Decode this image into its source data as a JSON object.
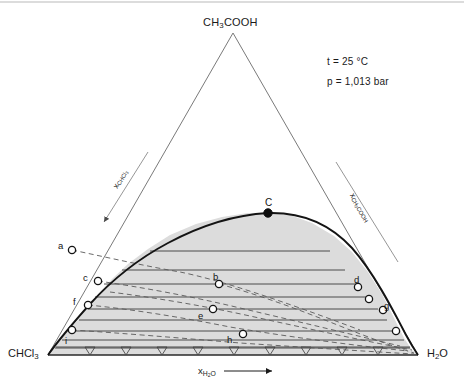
{
  "diagram": {
    "type": "ternary-phase-diagram",
    "title_apex": "CH3COOH",
    "corner_left": "CHCl3",
    "corner_right": "H2O",
    "conditions": {
      "temperature": "t = 25 °C",
      "pressure": "p = 1,013 bar"
    },
    "axes": {
      "bottom_label": "x",
      "bottom_sub": "H₂O",
      "left_label": "x",
      "left_sub": "CHCl₃",
      "right_label": "x",
      "right_sub": "CH₃COOH"
    },
    "colors": {
      "two_phase_fill": "#d9d9d9",
      "binodal_curve": "#1a1a1a",
      "tie_line": "#333333",
      "conjugate_dashed": "#555555",
      "triangle_edge": "#6b6b6b",
      "text": "#1a1a1a"
    },
    "plait_point": {
      "label": "C",
      "x": 268,
      "y": 214,
      "filled": true
    },
    "points": [
      {
        "label": "a",
        "x": 72,
        "y": 250,
        "label_dx": -11,
        "label_dy": -4,
        "on_curve": false
      },
      {
        "label": "c",
        "x": 98,
        "y": 281,
        "label_dx": -12,
        "label_dy": -3,
        "on_curve": true
      },
      {
        "label": "f",
        "x": 88,
        "y": 305,
        "label_dx": -12,
        "label_dy": -3,
        "on_curve": true
      },
      {
        "label": "i",
        "x": 72,
        "y": 330,
        "label_dx": -4,
        "label_dy": 11,
        "on_curve": true
      },
      {
        "label": "b",
        "x": 219,
        "y": 284,
        "label_dx": -3,
        "label_dy": -7,
        "on_curve": false
      },
      {
        "label": "e",
        "x": 213,
        "y": 309,
        "label_dx": -12,
        "label_dy": 7,
        "on_curve": false
      },
      {
        "label": "h",
        "x": 243,
        "y": 334,
        "label_dx": -13,
        "label_dy": 6,
        "on_curve": false
      },
      {
        "label": "d",
        "x": 358,
        "y": 287,
        "label_dx": -1,
        "label_dy": -7,
        "on_curve": true
      },
      {
        "label": "g",
        "x": 383,
        "y": 310,
        "label_dx": 4,
        "label_dy": -4,
        "on_curve": true
      },
      {
        "label": "",
        "x": 368,
        "y": 298,
        "label_dx": 0,
        "label_dy": 0,
        "on_curve": true
      },
      {
        "label": "",
        "x": 396,
        "y": 330,
        "label_dx": 0,
        "label_dy": 0,
        "on_curve": true
      }
    ],
    "tie_line_count": 9,
    "tick_count": 9,
    "region_note": "two-phase miscibility gap below binodal curve"
  },
  "chart_data": {
    "type": "scatter",
    "xlabel": "x_H2O",
    "ylabel": "x_CHCl3 / x_CH3COOH",
    "legend": [],
    "annotations": [
      "t = 25 °C",
      "p = 1,013 bar"
    ],
    "labeled_points": [
      "a",
      "b",
      "c",
      "d",
      "e",
      "f",
      "g",
      "h",
      "i",
      "C"
    ],
    "binodal_curve": [
      [
        48,
        355
      ],
      [
        58,
        341
      ],
      [
        68,
        331
      ],
      [
        78,
        320
      ],
      [
        88,
        307
      ],
      [
        100,
        292
      ],
      [
        112,
        279
      ],
      [
        128,
        264
      ],
      [
        148,
        249
      ],
      [
        170,
        235
      ],
      [
        196,
        224
      ],
      [
        222,
        217
      ],
      [
        248,
        213
      ],
      [
        268,
        213
      ],
      [
        290,
        215
      ],
      [
        312,
        223
      ],
      [
        334,
        236
      ],
      [
        352,
        252
      ],
      [
        368,
        272
      ],
      [
        382,
        294
      ],
      [
        394,
        318
      ],
      [
        404,
        338
      ],
      [
        412,
        350
      ],
      [
        418,
        355
      ]
    ],
    "tie_lines": [
      {
        "left": [
          120,
          271
        ],
        "right": [
          344,
          271
        ]
      },
      {
        "left": [
          106,
          287
        ],
        "right": [
          360,
          287
        ]
      },
      {
        "left": [
          96,
          299
        ],
        "right": [
          370,
          299
        ]
      },
      {
        "left": [
          88,
          310
        ],
        "right": [
          379,
          310
        ]
      },
      {
        "left": [
          80,
          320
        ],
        "right": [
          387,
          320
        ]
      },
      {
        "left": [
          72,
          330
        ],
        "right": [
          396,
          330
        ]
      },
      {
        "left": [
          64,
          338
        ],
        "right": [
          403,
          338
        ]
      },
      {
        "left": [
          56,
          347
        ],
        "right": [
          410,
          347
        ]
      }
    ],
    "grid": false
  }
}
